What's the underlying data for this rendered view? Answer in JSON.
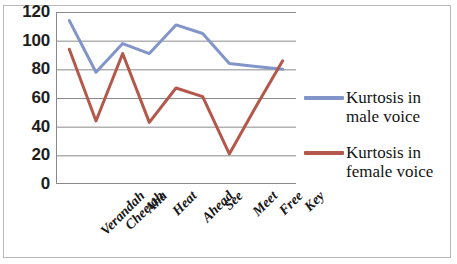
{
  "chart_data": {
    "type": "line",
    "title": "",
    "xlabel": "",
    "ylabel": "",
    "ylim": [
      0,
      120
    ],
    "ytick_step": 20,
    "yticks": [
      120,
      100,
      80,
      60,
      40,
      20,
      0
    ],
    "grid": true,
    "legend_position": "right",
    "categories": [
      "Verandah",
      "Cheetah",
      "Aha",
      "Heat",
      "Ahead",
      "See",
      "Meet",
      "Free",
      "Key"
    ],
    "series": [
      {
        "name": "Kurtosis in male voice",
        "color": "#8295c8",
        "values": [
          114,
          78,
          98,
          91,
          111,
          105,
          84,
          82,
          80
        ]
      },
      {
        "name": "Kurtosis in female voice",
        "color": "#b3584a",
        "values": [
          94,
          44,
          91,
          43,
          67,
          61,
          21,
          54,
          86
        ]
      }
    ]
  },
  "legend": {
    "entries": [
      {
        "label": "Kurtosis in male voice",
        "color": "#8295c8"
      },
      {
        "label": "Kurtosis in female voice",
        "color": "#b3584a"
      }
    ]
  }
}
